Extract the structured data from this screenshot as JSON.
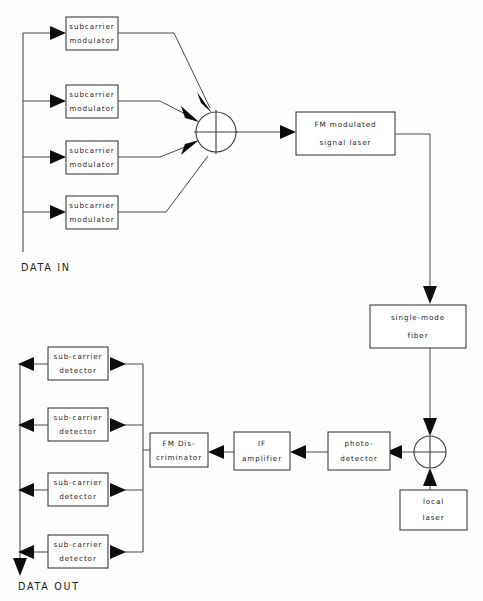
{
  "diagram": {
    "colors": {
      "background": "#fefefe",
      "stroke": "#4a4a4a",
      "box_stroke": "#2a2a2a",
      "arrow_fill": "#0d0d0d",
      "text": "#1c1c1c"
    },
    "transmitter": {
      "input_label": "DATA IN",
      "modulators": [
        {
          "line1": "subcarrier",
          "line2": "modulator"
        },
        {
          "line1": "subcarrier",
          "line2": "modulator"
        },
        {
          "line1": "subcarrier",
          "line2": "modulator"
        },
        {
          "line1": "subcarrier",
          "line2": "modulator"
        }
      ],
      "summing_node": {
        "name": "summing-junction",
        "symbol": "cross-in-circle"
      },
      "laser": {
        "line1": "FM modulated",
        "line2": "signal laser"
      }
    },
    "channel": {
      "fiber": {
        "line1": "single-mode",
        "line2": "fiber"
      }
    },
    "receiver": {
      "output_label": "DATA OUT",
      "mixer_node": {
        "name": "optical-mixer",
        "symbol": "cross-in-circle"
      },
      "local_oscillator": {
        "line1": "local",
        "line2": "laser"
      },
      "photodetector": {
        "line1": "photo-",
        "line2": "detector"
      },
      "if_amplifier": {
        "line1": "IF",
        "line2": "amplifier"
      },
      "discriminator": {
        "line1": "FM  Dis-",
        "line2": "criminator"
      },
      "detectors": [
        {
          "line1": "sub-carrier",
          "line2": "detector"
        },
        {
          "line1": "sub-carrier",
          "line2": "detector"
        },
        {
          "line1": "sub-carrier",
          "line2": "detector"
        },
        {
          "line1": "sub-carrier",
          "line2": "detector"
        }
      ]
    }
  }
}
